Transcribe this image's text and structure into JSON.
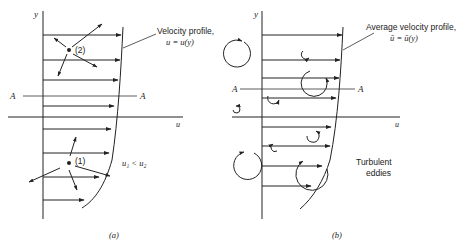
{
  "figure": {
    "panel_a": {
      "caption": "(a)",
      "y_axis_label": "y",
      "x_axis_label": "u",
      "section_line_label_left": "A",
      "section_line_label_right": "A",
      "profile_label_line1": "Velocity profile,",
      "profile_label_line2": "u = u(y)",
      "point_upper_label": "(2)",
      "point_lower_label": "(1)",
      "relation_label": "u₁ < u₂"
    },
    "panel_b": {
      "caption": "(b)",
      "y_axis_label": "y",
      "x_axis_label": "u",
      "section_line_label_left": "A",
      "section_line_label_right": "A",
      "profile_label_line1": "Average velocity profile,",
      "profile_label_line2": "ū = ū(y)",
      "eddies_label_line1": "Turbulent",
      "eddies_label_line2": "eddies"
    },
    "colors": {
      "ink": "#222222",
      "background": "#ffffff"
    }
  }
}
